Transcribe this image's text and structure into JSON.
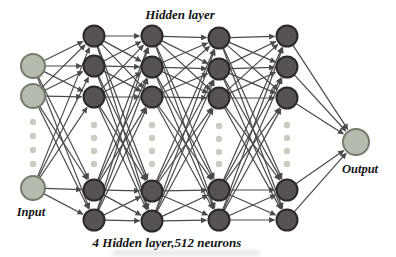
{
  "labels": {
    "hidden_layer": "Hidden layer",
    "input": "Input",
    "output": "Output",
    "caption": "4 Hidden layer,512 neurons"
  },
  "colors": {
    "background": "#ffffff",
    "hidden_node_fill": "#575354",
    "hidden_node_stroke": "#2b2828",
    "io_node_fill": "#b6bbaf",
    "io_node_stroke": "#757c6d",
    "dot_fill": "#c9cdc1",
    "edge": "#4a4a4a",
    "text": "#141414"
  },
  "network": {
    "hidden_layer_count": 4,
    "neurons_per_hidden_layer": 512,
    "edge_rule": "adjacent-fully-connected",
    "columns": [
      {
        "id": "input",
        "role": "input",
        "x": 33,
        "radius": 12,
        "nodes_y": [
          66,
          96,
          188
        ],
        "dots_y": [
          122,
          136,
          150,
          164
        ]
      },
      {
        "id": "hidden-1",
        "role": "hidden",
        "x": 94,
        "radius": 10.5,
        "nodes_y": [
          36,
          66,
          97,
          190,
          220
        ],
        "dots_y": [
          125,
          138,
          151,
          164
        ]
      },
      {
        "id": "hidden-2",
        "role": "hidden",
        "x": 152,
        "radius": 10.5,
        "nodes_y": [
          36,
          67,
          97,
          191,
          221
        ],
        "dots_y": [
          125,
          138,
          151,
          164
        ]
      },
      {
        "id": "hidden-3",
        "role": "hidden",
        "x": 219,
        "radius": 10.5,
        "nodes_y": [
          38,
          69,
          98,
          190,
          220
        ],
        "dots_y": [
          126,
          139,
          152,
          164
        ]
      },
      {
        "id": "hidden-4",
        "role": "hidden",
        "x": 287,
        "radius": 10.5,
        "nodes_y": [
          36,
          67,
          98,
          190,
          220
        ],
        "dots_y": [
          125,
          138,
          151,
          164
        ]
      },
      {
        "id": "output",
        "role": "output",
        "x": 356,
        "radius": 13,
        "nodes_y": [
          142
        ],
        "dots_y": []
      }
    ]
  }
}
